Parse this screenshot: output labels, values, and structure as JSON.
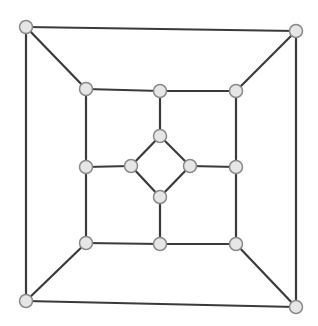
{
  "diagram": {
    "type": "graph",
    "colors": {
      "edge": "#3a3a3a",
      "node_fill": "#e6e6e6",
      "node_stroke": "#8a8a8a",
      "background": "#ffffff"
    },
    "nodes": [
      {
        "id": "o1",
        "x": 26,
        "y": 27
      },
      {
        "id": "o2",
        "x": 296,
        "y": 31
      },
      {
        "id": "o3",
        "x": 296,
        "y": 307
      },
      {
        "id": "o4",
        "x": 26,
        "y": 301
      },
      {
        "id": "m1",
        "x": 86,
        "y": 89
      },
      {
        "id": "m2",
        "x": 160,
        "y": 91
      },
      {
        "id": "m3",
        "x": 236,
        "y": 91
      },
      {
        "id": "m4",
        "x": 236,
        "y": 167
      },
      {
        "id": "m5",
        "x": 236,
        "y": 244
      },
      {
        "id": "m6",
        "x": 160,
        "y": 244
      },
      {
        "id": "m7",
        "x": 86,
        "y": 243
      },
      {
        "id": "m8",
        "x": 86,
        "y": 167
      },
      {
        "id": "i1",
        "x": 160,
        "y": 136
      },
      {
        "id": "i2",
        "x": 190,
        "y": 166
      },
      {
        "id": "i3",
        "x": 160,
        "y": 197
      },
      {
        "id": "i4",
        "x": 131,
        "y": 166
      }
    ],
    "edges": [
      [
        "o1",
        "o2"
      ],
      [
        "o2",
        "o3"
      ],
      [
        "o3",
        "o4"
      ],
      [
        "o4",
        "o1"
      ],
      [
        "o1",
        "m1"
      ],
      [
        "o2",
        "m3"
      ],
      [
        "o3",
        "m5"
      ],
      [
        "o4",
        "m7"
      ],
      [
        "m1",
        "m2"
      ],
      [
        "m2",
        "m3"
      ],
      [
        "m3",
        "m4"
      ],
      [
        "m4",
        "m5"
      ],
      [
        "m5",
        "m6"
      ],
      [
        "m6",
        "m7"
      ],
      [
        "m7",
        "m8"
      ],
      [
        "m8",
        "m1"
      ],
      [
        "m2",
        "i1"
      ],
      [
        "m4",
        "i2"
      ],
      [
        "m6",
        "i3"
      ],
      [
        "m8",
        "i4"
      ],
      [
        "i1",
        "i2"
      ],
      [
        "i2",
        "i3"
      ],
      [
        "i3",
        "i4"
      ],
      [
        "i4",
        "i1"
      ]
    ]
  }
}
